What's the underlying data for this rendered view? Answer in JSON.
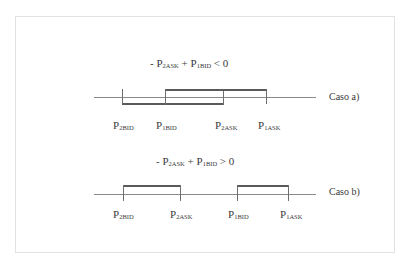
{
  "diagram": {
    "case_a": {
      "formula": {
        "prefix": "- P",
        "sub1": "2ASK",
        "mid": " + P",
        "sub2": "1BID",
        "suffix": " < 0"
      },
      "case_label": "Caso a)",
      "labels": [
        {
          "p": "P",
          "sub": "2BID"
        },
        {
          "p": "P",
          "sub": "1BID"
        },
        {
          "p": "P",
          "sub": "2ASK"
        },
        {
          "p": "P",
          "sub": "1ASK"
        }
      ]
    },
    "case_b": {
      "formula": {
        "prefix": "- P",
        "sub1": "2ASK",
        "mid": " + P",
        "sub2": "1BID",
        "suffix": " > 0"
      },
      "case_label": "Caso b)",
      "labels": [
        {
          "p": "P",
          "sub": "2BID"
        },
        {
          "p": "P",
          "sub": "2ASK"
        },
        {
          "p": "P",
          "sub": "1BID"
        },
        {
          "p": "P",
          "sub": "1ASK"
        }
      ]
    }
  }
}
